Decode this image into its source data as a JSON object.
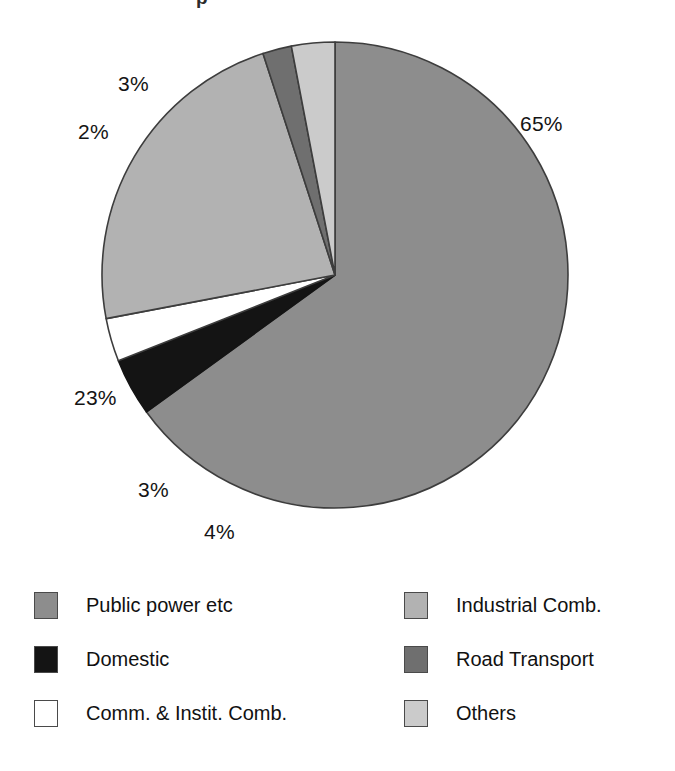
{
  "figure": {
    "title_fragment": "p",
    "background": "#ffffff"
  },
  "chart_data": {
    "type": "pie",
    "title": "",
    "subtitle": "",
    "xlabel": "",
    "ylabel": "",
    "grid": false,
    "legend_position": "bottom",
    "units": "percent",
    "total": 100,
    "start_angle_deg": 0,
    "direction": "clockwise",
    "categories": [
      "Public power etc",
      "Domestic",
      "Comm. & Instit. Comb.",
      "Industrial Comb.",
      "Road Transport",
      "Others"
    ],
    "values": [
      65,
      4,
      3,
      23,
      2,
      3
    ],
    "labels": [
      "65%",
      "4%",
      "3%",
      "23%",
      "2%",
      "3%"
    ],
    "colors": [
      "#8d8d8d",
      "#141414",
      "#ffffff",
      "#b2b2b2",
      "#6f6f6f",
      "#cbcbcb"
    ],
    "slices": [
      {
        "name": "Public power etc",
        "value": 65,
        "label": "65%",
        "color": "#8d8d8d",
        "stroke": "#3d3d3d"
      },
      {
        "name": "Domestic",
        "value": 4,
        "label": "4%",
        "color": "#141414",
        "stroke": "#141414"
      },
      {
        "name": "Comm. & Instit. Comb.",
        "value": 3,
        "label": "3%",
        "color": "#ffffff",
        "stroke": "#3d3d3d"
      },
      {
        "name": "Industrial Comb.",
        "value": 23,
        "label": "23%",
        "color": "#b2b2b2",
        "stroke": "#3d3d3d"
      },
      {
        "name": "Road Transport",
        "value": 2,
        "label": "2%",
        "color": "#6f6f6f",
        "stroke": "#3d3d3d"
      },
      {
        "name": "Others",
        "value": 3,
        "label": "3%",
        "color": "#cbcbcb",
        "stroke": "#3d3d3d"
      }
    ]
  },
  "pie_geometry": {
    "center_x": 335,
    "center_y": 275,
    "radius": 233
  },
  "pct_labels": [
    {
      "key": "public_power",
      "text": "65%",
      "left": 520,
      "top": 112
    },
    {
      "key": "domestic",
      "text": "4%",
      "left": 204,
      "top": 520
    },
    {
      "key": "comm_instit",
      "text": "3%",
      "left": 138,
      "top": 478
    },
    {
      "key": "industrial",
      "text": "23%",
      "left": 74,
      "top": 386
    },
    {
      "key": "road",
      "text": "2%",
      "left": 78,
      "top": 120
    },
    {
      "key": "others",
      "text": "3%",
      "left": 118,
      "top": 72
    }
  ],
  "legend": {
    "columns": [
      {
        "key": "left",
        "items": [
          {
            "label": "Public power etc",
            "color": "#8d8d8d"
          },
          {
            "label": "Domestic",
            "color": "#141414"
          },
          {
            "label": "Comm. & Instit. Comb.",
            "color": "#ffffff"
          }
        ]
      },
      {
        "key": "right",
        "items": [
          {
            "label": "Industrial Comb.",
            "color": "#b2b2b2"
          },
          {
            "label": "Road Transport",
            "color": "#6f6f6f"
          },
          {
            "label": "Others",
            "color": "#cbcbcb"
          }
        ]
      }
    ]
  }
}
